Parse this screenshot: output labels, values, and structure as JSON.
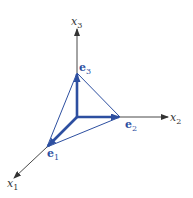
{
  "diagram": {
    "type": "3d-coordinate-axes",
    "colors": {
      "axis": "#333333",
      "vector": "#2d4fa0"
    },
    "axes": [
      {
        "name": "x1",
        "base": "x",
        "sub": "1"
      },
      {
        "name": "x2",
        "base": "x",
        "sub": "2"
      },
      {
        "name": "x3",
        "base": "x",
        "sub": "3"
      }
    ],
    "vectors": [
      {
        "name": "e1",
        "base": "e",
        "sub": "1"
      },
      {
        "name": "e2",
        "base": "e",
        "sub": "2"
      },
      {
        "name": "e3",
        "base": "e",
        "sub": "3"
      }
    ],
    "triangle": [
      "e1",
      "e2",
      "e3"
    ]
  }
}
